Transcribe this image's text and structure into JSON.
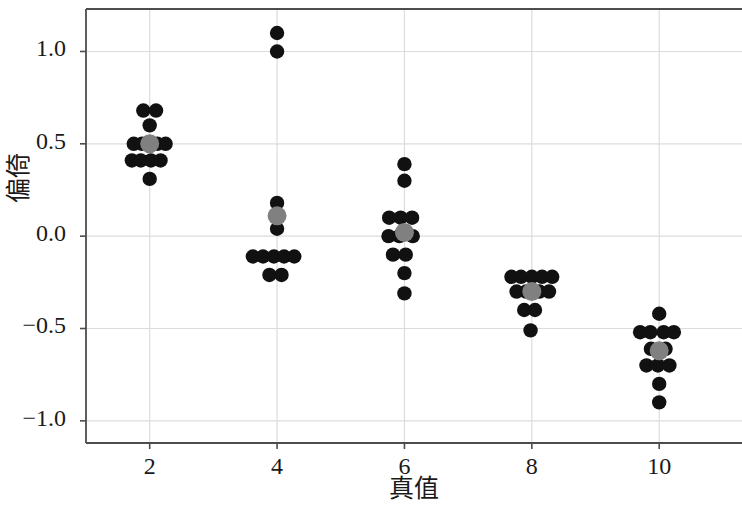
{
  "chart_data": {
    "type": "scatter",
    "title": "",
    "xlabel": "真值",
    "ylabel": "偏倚",
    "xlim": [
      1.0,
      11.3
    ],
    "ylim": [
      -1.12,
      1.23
    ],
    "xticks": [
      2,
      4,
      6,
      8,
      10
    ],
    "xtick_labels": [
      "2",
      "4",
      "6",
      "8",
      "10"
    ],
    "yticks": [
      1.0,
      0.5,
      0.0,
      -0.5,
      -1.0
    ],
    "ytick_labels": [
      "1.0",
      "0.5",
      "0.0",
      "−0.5",
      "−1.0"
    ],
    "grid": true,
    "legend": "none",
    "point_color": "#111111",
    "mean_color": "#808080",
    "groups": [
      {
        "x": 2,
        "mean": 0.5,
        "points": [
          {
            "dx": -0.1,
            "y": 0.68
          },
          {
            "dx": 0.1,
            "y": 0.68
          },
          {
            "dx": 0.0,
            "y": 0.6
          },
          {
            "dx": -0.25,
            "y": 0.5
          },
          {
            "dx": -0.12,
            "y": 0.5
          },
          {
            "dx": 0.12,
            "y": 0.5
          },
          {
            "dx": 0.25,
            "y": 0.5
          },
          {
            "dx": -0.28,
            "y": 0.41
          },
          {
            "dx": -0.14,
            "y": 0.41
          },
          {
            "dx": 0.02,
            "y": 0.41
          },
          {
            "dx": 0.17,
            "y": 0.41
          },
          {
            "dx": 0.0,
            "y": 0.31
          }
        ]
      },
      {
        "x": 4,
        "mean": 0.11,
        "points": [
          {
            "dx": 0.0,
            "y": 1.1
          },
          {
            "dx": 0.0,
            "y": 1.0
          },
          {
            "dx": 0.0,
            "y": 0.18
          },
          {
            "dx": 0.0,
            "y": 0.04
          },
          {
            "dx": -0.38,
            "y": -0.11
          },
          {
            "dx": -0.22,
            "y": -0.11
          },
          {
            "dx": -0.05,
            "y": -0.11
          },
          {
            "dx": 0.11,
            "y": -0.11
          },
          {
            "dx": 0.27,
            "y": -0.11
          },
          {
            "dx": -0.12,
            "y": -0.21
          },
          {
            "dx": 0.07,
            "y": -0.21
          }
        ]
      },
      {
        "x": 6,
        "mean": 0.02,
        "points": [
          {
            "dx": 0.0,
            "y": 0.39
          },
          {
            "dx": 0.0,
            "y": 0.3
          },
          {
            "dx": -0.24,
            "y": 0.1
          },
          {
            "dx": -0.06,
            "y": 0.1
          },
          {
            "dx": 0.12,
            "y": 0.1
          },
          {
            "dx": -0.25,
            "y": 0.0
          },
          {
            "dx": -0.08,
            "y": 0.0
          },
          {
            "dx": 0.13,
            "y": 0.0
          },
          {
            "dx": -0.18,
            "y": -0.1
          },
          {
            "dx": 0.02,
            "y": -0.1
          },
          {
            "dx": 0.0,
            "y": -0.2
          },
          {
            "dx": 0.0,
            "y": -0.31
          }
        ]
      },
      {
        "x": 8,
        "mean": -0.3,
        "points": [
          {
            "dx": -0.32,
            "y": -0.22
          },
          {
            "dx": -0.17,
            "y": -0.22
          },
          {
            "dx": 0.0,
            "y": -0.22
          },
          {
            "dx": 0.16,
            "y": -0.22
          },
          {
            "dx": 0.32,
            "y": -0.22
          },
          {
            "dx": -0.24,
            "y": -0.3
          },
          {
            "dx": -0.09,
            "y": -0.3
          },
          {
            "dx": 0.12,
            "y": -0.3
          },
          {
            "dx": 0.27,
            "y": -0.3
          },
          {
            "dx": -0.12,
            "y": -0.4
          },
          {
            "dx": 0.05,
            "y": -0.4
          },
          {
            "dx": -0.02,
            "y": -0.51
          }
        ]
      },
      {
        "x": 10,
        "mean": -0.62,
        "points": [
          {
            "dx": 0.0,
            "y": -0.42
          },
          {
            "dx": -0.3,
            "y": -0.52
          },
          {
            "dx": -0.14,
            "y": -0.52
          },
          {
            "dx": 0.07,
            "y": -0.52
          },
          {
            "dx": 0.23,
            "y": -0.52
          },
          {
            "dx": -0.13,
            "y": -0.61
          },
          {
            "dx": 0.1,
            "y": -0.61
          },
          {
            "dx": -0.2,
            "y": -0.7
          },
          {
            "dx": -0.02,
            "y": -0.7
          },
          {
            "dx": 0.16,
            "y": -0.7
          },
          {
            "dx": 0.0,
            "y": -0.8
          },
          {
            "dx": 0.0,
            "y": -0.9
          }
        ]
      }
    ]
  },
  "axes": {
    "frame_color": "#4d4d4d",
    "grid_color": "#dcdcdc",
    "background": "#ffffff"
  }
}
